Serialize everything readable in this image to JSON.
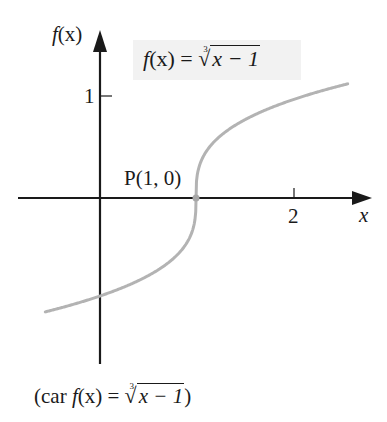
{
  "chart_data": {
    "type": "line",
    "function": "f(x) = cbrt(x - 1)",
    "xlabel": "x",
    "ylabel": "f(x)",
    "x_ticks": [
      {
        "value": 2,
        "label": "2"
      }
    ],
    "y_ticks": [
      {
        "value": 1,
        "label": "1"
      }
    ],
    "xlim": [
      -0.6,
      2.8
    ],
    "ylim": [
      -1.6,
      1.5
    ],
    "grid": false,
    "series": [
      {
        "name": "f(x) = ∛(x − 1)",
        "color": "#b3b3b3",
        "x": [
          -0.57,
          -0.25,
          0,
          0.25,
          0.5,
          0.75,
          0.9,
          0.97,
          1,
          1.03,
          1.1,
          1.25,
          1.5,
          1.75,
          2,
          2.25,
          2.58
        ],
        "y": [
          -1.16,
          -1.08,
          -1.0,
          -0.91,
          -0.79,
          -0.63,
          -0.46,
          -0.31,
          0,
          0.31,
          0.46,
          0.63,
          0.79,
          0.91,
          1.0,
          1.08,
          1.16
        ]
      }
    ],
    "annotations": [
      {
        "text": "P(1, 0)",
        "x": 1,
        "y": 0,
        "marker": "point"
      }
    ],
    "caption": "(car f(x) = ∛(x − 1))"
  },
  "labels": {
    "y_axis": {
      "f": "f",
      "arg": "(x)"
    },
    "x_axis": "x",
    "tick_x2": "2",
    "tick_y1": "1",
    "point_p": "P(1, 0)",
    "formula": {
      "lhs_f": "f",
      "lhs_arg": "(x)",
      "eq": " = ",
      "index": "3",
      "radical": "√",
      "radicand": "x − 1"
    },
    "caption": {
      "open": "(car ",
      "f": "f",
      "arg": "(x)",
      "eq": " = ",
      "index": "3",
      "radical": "√",
      "radicand": "x − 1",
      "close": ")"
    }
  },
  "colors": {
    "axis": "#1a1a1a",
    "curve": "#b3b3b3",
    "formula_bg": "#f2f2f2"
  }
}
